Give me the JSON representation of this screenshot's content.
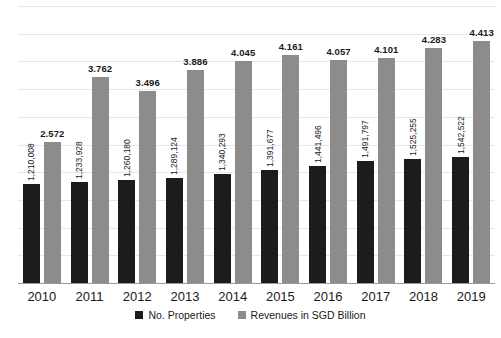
{
  "chart_data": {
    "type": "bar",
    "title": "",
    "subtitle": "",
    "xlabel": "",
    "ylabel": "",
    "ylim": [
      0,
      5
    ],
    "grid": true,
    "gridline_count": 10,
    "legend_position": "bottom-center",
    "categories": [
      "2010",
      "2011",
      "2012",
      "2013",
      "2014",
      "2015",
      "2016",
      "2017",
      "2018",
      "2019"
    ],
    "series": [
      {
        "name": "No. Properties",
        "color": "#1c1c1c",
        "axis": "count",
        "values": [
          1210008,
          1233928,
          1260180,
          1289124,
          1340293,
          1391677,
          1441496,
          1491797,
          1525255,
          1542522
        ],
        "labels": [
          "1,210,008",
          "1,233,928",
          "1,260,180",
          "1,289,124",
          "1,340,293",
          "1,391,677",
          "1,441,496",
          "1,491,797",
          "1,525,255",
          "1,542,522"
        ],
        "label_orientation": "vertical"
      },
      {
        "name": "Revenues in SGD Billion",
        "color": "#8c8c8c",
        "axis": "revenue",
        "values": [
          2.572,
          3.762,
          3.496,
          3.886,
          4.045,
          4.161,
          4.057,
          4.101,
          4.283,
          4.413
        ],
        "labels": [
          "2.572",
          "3.762",
          "3.496",
          "3.886",
          "4.045",
          "4.161",
          "4.057",
          "4.101",
          "4.283",
          "4.413"
        ],
        "label_orientation": "horizontal"
      }
    ]
  },
  "legend": {
    "items": [
      {
        "label": "No. Properties",
        "color": "#1c1c1c"
      },
      {
        "label": "Revenues in SGD Billion",
        "color": "#8c8c8c"
      }
    ]
  },
  "colors": {
    "properties_bar": "#1c1c1c",
    "revenue_bar": "#8c8c8c",
    "gridline": "#e4e6e8",
    "axis": "#9a9a9a",
    "background": "#ffffff",
    "text": "#1a1a1a"
  }
}
